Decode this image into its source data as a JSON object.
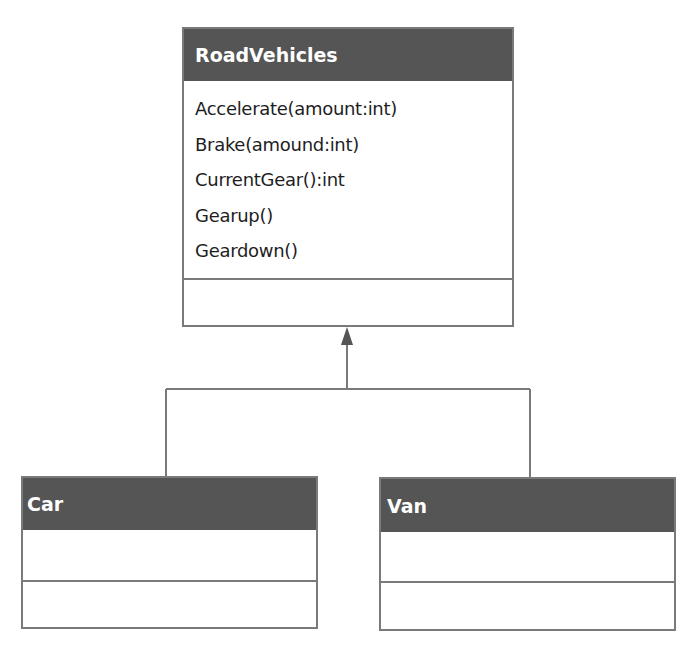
{
  "diagram": {
    "type": "uml-class-inheritance",
    "colors": {
      "header_bg": "#555555",
      "header_text": "#ffffff",
      "border": "#7a7a7a",
      "line": "#7a7a7a"
    },
    "parent": {
      "name": "RoadVehicles",
      "methods": [
        "Accelerate(amount:int)",
        "Brake(amound:int)",
        "CurrentGear():int",
        "Gearup()",
        "Geardown()"
      ],
      "attributes": []
    },
    "children": [
      {
        "name": "Car",
        "methods": [],
        "attributes": []
      },
      {
        "name": "Van",
        "methods": [],
        "attributes": []
      }
    ],
    "relationship": "generalization"
  }
}
